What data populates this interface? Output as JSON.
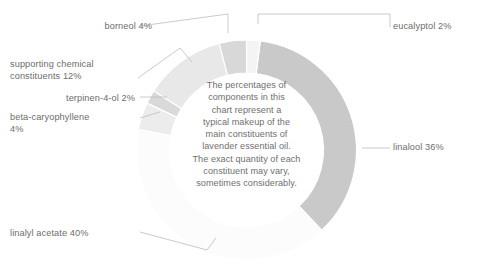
{
  "chart_data": {
    "type": "pie",
    "variant": "donut",
    "title": "",
    "xlabel": "",
    "ylabel": "",
    "units": "percent",
    "center_note": "The percentages of\ncomponents in this\nchart represent a\ntypical makeup of the\nmain constituents of\nlavender essential oil.\nThe exact quantity of each\nconstituent may vary,\nsometimes considerably.",
    "categories": [
      "linalyl acetate",
      "linalool",
      "eucalyptol",
      "borneol",
      "supporting chemical constituents",
      "terpinen-4-ol",
      "beta-caryophyllene"
    ],
    "values": [
      40,
      36,
      2,
      4,
      12,
      2,
      4
    ],
    "slices": [
      {
        "name": "linalyl-acetate",
        "label": "linalyl acetate 40%",
        "value": 40,
        "color": "#fcfcfc"
      },
      {
        "name": "linalool",
        "label": "linalool 36%",
        "value": 36,
        "color": "#c9c9c9"
      },
      {
        "name": "eucalyptol",
        "label": "eucalyptol 2%",
        "value": 2,
        "color": "#f4f4f4"
      },
      {
        "name": "borneol",
        "label": "borneol 4%",
        "value": 4,
        "color": "#d8d8d8"
      },
      {
        "name": "supporting",
        "label": "supporting chemical\nconstituents 12%",
        "value": 12,
        "color": "#e8e8e8"
      },
      {
        "name": "terpinen-4-ol",
        "label": "terpinen-4-ol 2%",
        "value": 2,
        "color": "#d9d9d9"
      },
      {
        "name": "beta-caryophyllene",
        "label": "beta-caryophyllene\n4%",
        "value": 4,
        "color": "#ececec"
      }
    ],
    "legend_position": "callout-labels",
    "grid": false,
    "leader_line_color": "#bdbdbd"
  },
  "labels": {
    "borneol": "borneol 4%",
    "supporting": "supporting chemical\nconstituents 12%",
    "terpinen": "terpinen-4-ol 2%",
    "beta": "beta-caryophyllene\n4%",
    "linalyl": "linalyl acetate 40%",
    "eucalyptol": "eucalyptol 2%",
    "linalool": "linalool 36%"
  },
  "colors": {
    "text": "#6d6d6d",
    "background": "#ffffff",
    "leader": "#bdbdbd",
    "linalool": "#c9c9c9",
    "borneol": "#d8d8d8",
    "supporting": "#e8e8e8",
    "terpinen": "#d9d9d9",
    "beta": "#ececec",
    "eucalyptol": "#f4f4f4",
    "linalyl_acetate": "#fcfcfc"
  }
}
